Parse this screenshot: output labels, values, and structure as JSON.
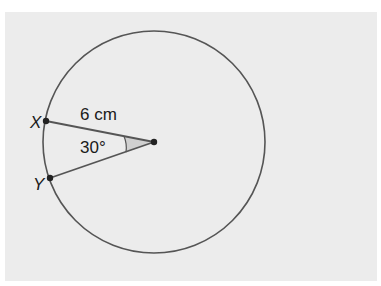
{
  "diagram": {
    "type": "circle-sector",
    "background_color": "#ececec",
    "line_color": "#555555",
    "sector_fill": "#d0d0d0",
    "points": {
      "X": {
        "label": "X"
      },
      "Y": {
        "label": "Y"
      },
      "center": {
        "label": ""
      }
    },
    "radius_label": "6 cm",
    "angle_label": "30°"
  }
}
